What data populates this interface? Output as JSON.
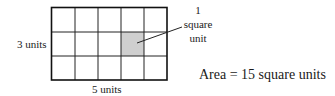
{
  "figure": {
    "grid": {
      "columns": 5,
      "rows": 3,
      "shaded_cell": {
        "column": 4,
        "row": 2
      },
      "shaded_color": "#cfcfcf",
      "line_color": "#222222"
    },
    "width_label": "5 units",
    "height_label": "3 units",
    "callout": {
      "line1": "1",
      "line2": "square",
      "line3": "unit"
    },
    "area_statement": "Area = 15 square units"
  }
}
